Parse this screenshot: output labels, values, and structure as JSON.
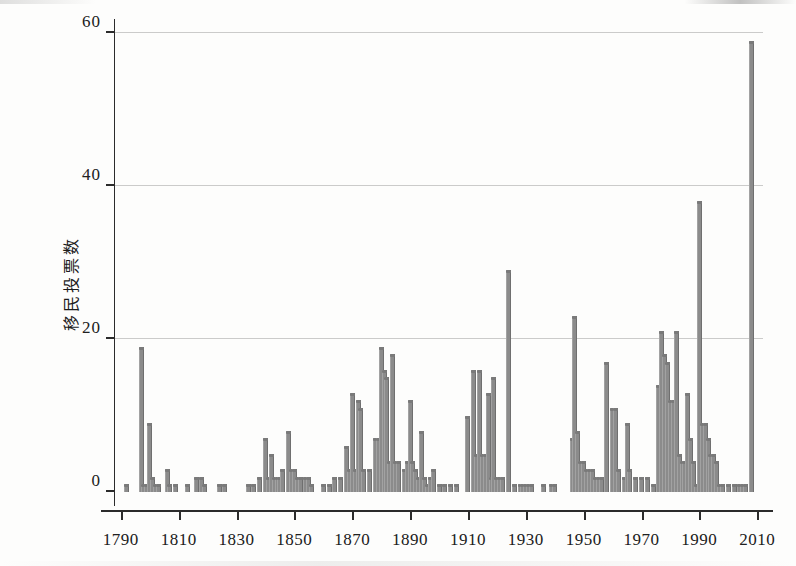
{
  "chart_data": {
    "type": "bar",
    "title": "",
    "subtitle": "",
    "xlabel": "",
    "ylabel": "移民投票数",
    "xlim": [
      1788,
      2012
    ],
    "ylim": [
      0,
      60
    ],
    "xticks": [
      1790,
      1810,
      1830,
      1850,
      1870,
      1890,
      1910,
      1930,
      1950,
      1970,
      1990,
      2010
    ],
    "xtick_labels": [
      "1790",
      "1810",
      "1830",
      "1850",
      "1870",
      "1890",
      "1910",
      "1930",
      "1950",
      "1970",
      "1990",
      "2010"
    ],
    "yticks": [
      0,
      20,
      40,
      60
    ],
    "ytick_labels": [
      "0",
      "20",
      "40",
      "60"
    ],
    "grid": "horizontal",
    "legend": "none",
    "bar_color": "#8b8b8b",
    "axis_color": "#2b2b2b",
    "grid_color": "#b9b9b9",
    "background_color": "#fdfdfc",
    "categories": [
      1792,
      1797,
      1798,
      1799,
      1800,
      1801,
      1802,
      1803,
      1806,
      1807,
      1809,
      1813,
      1816,
      1818,
      1819,
      1824,
      1826,
      1834,
      1836,
      1838,
      1840,
      1841,
      1842,
      1843,
      1844,
      1845,
      1846,
      1848,
      1849,
      1850,
      1851,
      1852,
      1854,
      1855,
      1856,
      1860,
      1862,
      1864,
      1866,
      1868,
      1869,
      1870,
      1871,
      1872,
      1873,
      1874,
      1876,
      1878,
      1879,
      1880,
      1881,
      1882,
      1883,
      1884,
      1885,
      1886,
      1888,
      1889,
      1890,
      1891,
      1892,
      1893,
      1894,
      1895,
      1896,
      1897,
      1898,
      1900,
      1902,
      1904,
      1906,
      1910,
      1912,
      1913,
      1914,
      1915,
      1916,
      1917,
      1918,
      1919,
      1920,
      1921,
      1922,
      1924,
      1926,
      1928,
      1929,
      1930,
      1931,
      1932,
      1936,
      1939,
      1940,
      1946,
      1947,
      1948,
      1949,
      1950,
      1951,
      1952,
      1953,
      1954,
      1955,
      1956,
      1958,
      1960,
      1961,
      1962,
      1964,
      1965,
      1966,
      1968,
      1970,
      1972,
      1974,
      1976,
      1977,
      1978,
      1979,
      1980,
      1981,
      1982,
      1983,
      1984,
      1985,
      1986,
      1987,
      1988,
      1989,
      1990,
      1991,
      1992,
      1993,
      1994,
      1995,
      1996,
      1997,
      1998,
      2000,
      2002,
      2004,
      2005,
      2006,
      2008
    ],
    "values": [
      1,
      19,
      1,
      1,
      9,
      2,
      1,
      1,
      3,
      1,
      1,
      1,
      2,
      2,
      1,
      1,
      1,
      1,
      1,
      2,
      7,
      2,
      5,
      2,
      2,
      2,
      3,
      8,
      3,
      3,
      2,
      2,
      2,
      2,
      1,
      1,
      1,
      2,
      2,
      6,
      3,
      13,
      3,
      12,
      11,
      3,
      3,
      7,
      7,
      19,
      16,
      15,
      4,
      18,
      4,
      4,
      3,
      4,
      12,
      4,
      3,
      2,
      8,
      2,
      1,
      2,
      3,
      1,
      1,
      1,
      1,
      10,
      16,
      5,
      16,
      5,
      5,
      13,
      2,
      15,
      2,
      2,
      2,
      29,
      1,
      1,
      1,
      1,
      1,
      1,
      1,
      1,
      1,
      7,
      23,
      8,
      4,
      4,
      3,
      3,
      3,
      2,
      2,
      2,
      17,
      11,
      11,
      3,
      2,
      9,
      3,
      2,
      2,
      2,
      1,
      14,
      21,
      18,
      17,
      12,
      12,
      21,
      5,
      4,
      4,
      13,
      7,
      4,
      1,
      38,
      9,
      9,
      7,
      5,
      5,
      4,
      1,
      1,
      1,
      1,
      1,
      1,
      1,
      59
    ]
  },
  "axis": {
    "y_title": "移民投票数"
  }
}
